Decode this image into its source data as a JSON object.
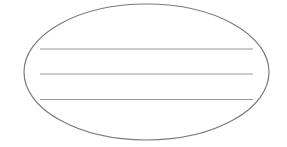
{
  "diagram": {
    "shape": "ellipse",
    "ellipse": {
      "cx": 146.5,
      "cy": 72,
      "rx": 122.5,
      "ry": 68,
      "stroke": "#7a7a7a",
      "stroke_width": 1.2,
      "fill": "#ffffff"
    },
    "lines": [
      {
        "x1": 40,
        "x2": 253,
        "y": 49,
        "stroke": "#9a9a9a"
      },
      {
        "x1": 40,
        "x2": 253,
        "y": 74,
        "stroke": "#9a9a9a"
      },
      {
        "x1": 40,
        "x2": 253,
        "y": 99.5,
        "stroke": "#9a9a9a"
      }
    ],
    "line_count": 3,
    "background": "#ffffff"
  }
}
